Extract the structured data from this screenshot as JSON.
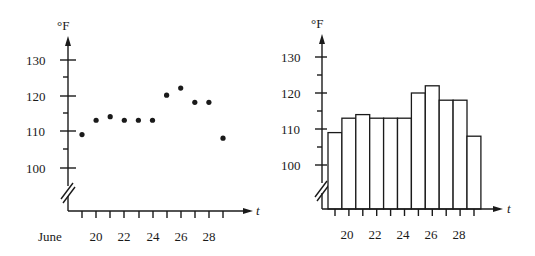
{
  "chart_data": [
    {
      "type": "scatter",
      "title": "",
      "xlabel": "t",
      "ylabel": "°F",
      "x_prefix_label": "June",
      "x": [
        19,
        20,
        21,
        22,
        23,
        24,
        25,
        26,
        27,
        28,
        29
      ],
      "values": [
        109,
        113,
        114,
        113,
        113,
        113,
        120,
        122,
        118,
        118,
        108
      ],
      "x_tick_labels": [
        "20",
        "22",
        "24",
        "26",
        "28"
      ],
      "y_tick_labels": [
        "100",
        "110",
        "120",
        "130"
      ],
      "ylim": [
        95,
        135
      ],
      "axis_break": true,
      "grid": false
    },
    {
      "type": "bar",
      "title": "",
      "xlabel": "t",
      "ylabel": "°F",
      "x": [
        19,
        20,
        21,
        22,
        23,
        24,
        25,
        26,
        27,
        28,
        29
      ],
      "values": [
        109,
        113,
        114,
        113,
        113,
        113,
        120,
        122,
        118,
        118,
        108
      ],
      "x_tick_labels": [
        "20",
        "22",
        "24",
        "26",
        "28"
      ],
      "y_tick_labels": [
        "100",
        "110",
        "120",
        "130"
      ],
      "ylim": [
        95,
        135
      ],
      "axis_break": true,
      "grid": false
    }
  ],
  "left": {
    "ylabel": "°F",
    "xlabel": "t",
    "june_label": "June",
    "yticks": [
      "130",
      "120",
      "110",
      "100"
    ],
    "xticks": [
      "20",
      "22",
      "24",
      "26",
      "28"
    ]
  },
  "right": {
    "ylabel": "°F",
    "xlabel": "t",
    "yticks": [
      "130",
      "120",
      "110",
      "100"
    ],
    "xticks": [
      "20",
      "22",
      "24",
      "26",
      "28"
    ]
  }
}
